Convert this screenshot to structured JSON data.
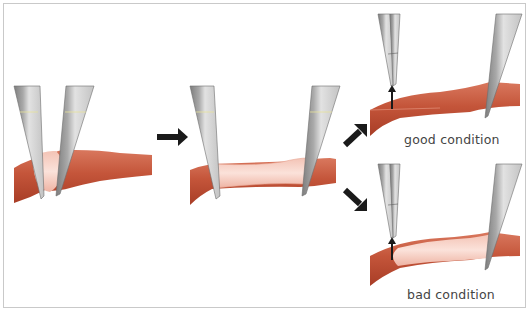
{
  "figure": {
    "colors": {
      "vessel": "#c4553a",
      "vessel_dark": "#a83d26",
      "dilated_segment": "#f6cfc4",
      "forceps_light": "#d9d9d9",
      "forceps_dark": "#8f8f8f",
      "arrow": "#1a1a1a",
      "frame": "#c9c9c9"
    },
    "panels": [
      {
        "id": "step1",
        "name": "forceps-clamping-vessel"
      },
      {
        "id": "step2",
        "name": "vessel-stretched-between-forceps"
      },
      {
        "id": "outcome_good",
        "name": "good-condition",
        "label": "good condition"
      },
      {
        "id": "outcome_bad",
        "name": "bad-condition",
        "label": "bad condition"
      }
    ],
    "arrows": [
      "step1-to-step2",
      "step2-to-good",
      "step2-to-bad"
    ]
  }
}
